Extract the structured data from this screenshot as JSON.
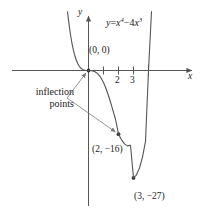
{
  "figure": {
    "equation": {
      "lhs": "y",
      "eq": "=",
      "term1_base": "x",
      "term1_exp": "4",
      "operator": "−",
      "term2_coef": "4",
      "term2_base": "x",
      "term2_exp": "3",
      "plain": "y = x⁴ − 4x³"
    },
    "axis_labels": {
      "x": "x",
      "y": "y"
    },
    "tick_labels": {
      "x": [
        "2",
        "3"
      ]
    },
    "annotations": {
      "origin_point": "(0, 0)",
      "inflection_line1": "inflection",
      "inflection_line2": "points",
      "inflection_full": "inflection points",
      "point_2_neg16": "(2, −16)",
      "point_3_neg27": "(3, −27)"
    },
    "colors": {
      "curve": "#555555",
      "axis": "#555555",
      "leader": "#777777",
      "marker": "#333333",
      "background": "#ffffff",
      "text": "#1a1a1a"
    }
  },
  "chart_data": {
    "type": "line",
    "title": "",
    "subtitle": "",
    "xlabel": "x",
    "ylabel": "y",
    "function": "y = x^4 - 4x^3",
    "grid": false,
    "legend": null,
    "xlim": [
      -1.4,
      5.0
    ],
    "ylim": [
      -32,
      52
    ],
    "xticks": [
      1,
      2,
      3,
      4
    ],
    "xtick_labels": [
      "",
      "2",
      "3",
      ""
    ],
    "yticks": [],
    "ytick_labels": [],
    "series": [
      {
        "name": "y = x^4 - 4x^3",
        "x": [
          -1.4,
          -1.3,
          -1.2,
          -1.1,
          -1.0,
          -0.9,
          -0.8,
          -0.7,
          -0.6,
          -0.5,
          -0.4,
          -0.3,
          -0.2,
          -0.1,
          0.0,
          0.2,
          0.4,
          0.6,
          0.8,
          1.0,
          1.2,
          1.4,
          1.6,
          1.8,
          2.0,
          2.2,
          2.4,
          2.6,
          2.8,
          3.0,
          3.2,
          3.4,
          3.6,
          3.8,
          4.0,
          4.2,
          4.4,
          4.6,
          4.8,
          5.0
        ],
        "y": [
          14.78,
          11.65,
          8.99,
          6.78,
          5.0,
          3.57,
          2.46,
          1.61,
          1.0,
          0.56,
          0.28,
          0.11,
          0.03,
          0.0,
          0.0,
          -0.03,
          -0.23,
          -0.73,
          -1.64,
          -3.0,
          -4.84,
          -7.09,
          -9.63,
          -12.25,
          -16.0,
          -17.42,
          -18.43,
          -18.94,
          -18.78,
          -27.0,
          -26.21,
          -24.5,
          -21.75,
          -17.8,
          0.0,
          14.82,
          27.12,
          42.46,
          61.44,
          125.0
        ]
      }
    ],
    "annotated_points": [
      {
        "label": "(0, 0)",
        "x": 0,
        "y": 0,
        "kind": "inflection"
      },
      {
        "label": "(2, −16)",
        "x": 2,
        "y": -16,
        "kind": "inflection"
      },
      {
        "label": "(3, −27)",
        "x": 3,
        "y": -27,
        "kind": "minimum"
      }
    ],
    "annotations": [
      {
        "text": "inflection points",
        "points_to": [
          "(0, 0)",
          "(2, −16)"
        ]
      }
    ]
  }
}
